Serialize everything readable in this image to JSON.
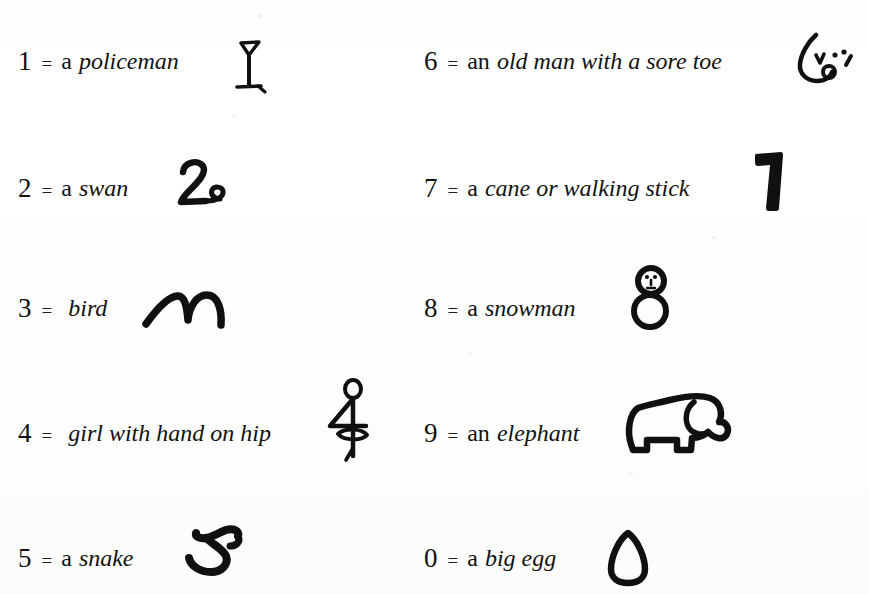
{
  "page": {
    "background_color": "#ffffff",
    "ink_color": "#101010"
  },
  "rows": [
    {
      "digit": "1",
      "equals": "=",
      "article": "a",
      "phrase": "policeman",
      "doodle_name": "policeman-doodle",
      "column": "left"
    },
    {
      "digit": "2",
      "equals": "=",
      "article": "a",
      "phrase": "swan",
      "doodle_name": "swan-doodle",
      "column": "left"
    },
    {
      "digit": "3",
      "equals": "=",
      "article": "",
      "phrase": "bird",
      "doodle_name": "bird-doodle",
      "column": "left"
    },
    {
      "digit": "4",
      "equals": "=",
      "article": "",
      "phrase": "girl with hand on hip",
      "doodle_name": "girl-with-hand-on-hip-doodle",
      "column": "left"
    },
    {
      "digit": "5",
      "equals": "=",
      "article": "a",
      "phrase": "snake",
      "doodle_name": "snake-doodle",
      "column": "left"
    },
    {
      "digit": "6",
      "equals": "=",
      "article": "an",
      "phrase": "old man with a sore toe",
      "doodle_name": "old-man-with-sore-toe-doodle",
      "column": "right"
    },
    {
      "digit": "7",
      "equals": "=",
      "article": "a",
      "phrase": "cane or walking stick",
      "doodle_name": "cane-doodle",
      "column": "right"
    },
    {
      "digit": "8",
      "equals": "=",
      "article": "a",
      "phrase": "snowman",
      "doodle_name": "snowman-doodle",
      "column": "right"
    },
    {
      "digit": "9",
      "equals": "=",
      "article": "an",
      "phrase": "elephant",
      "doodle_name": "elephant-doodle",
      "column": "right"
    },
    {
      "digit": "0",
      "equals": "=",
      "article": "a",
      "phrase": "big egg",
      "doodle_name": "big-egg-doodle",
      "column": "right"
    }
  ]
}
